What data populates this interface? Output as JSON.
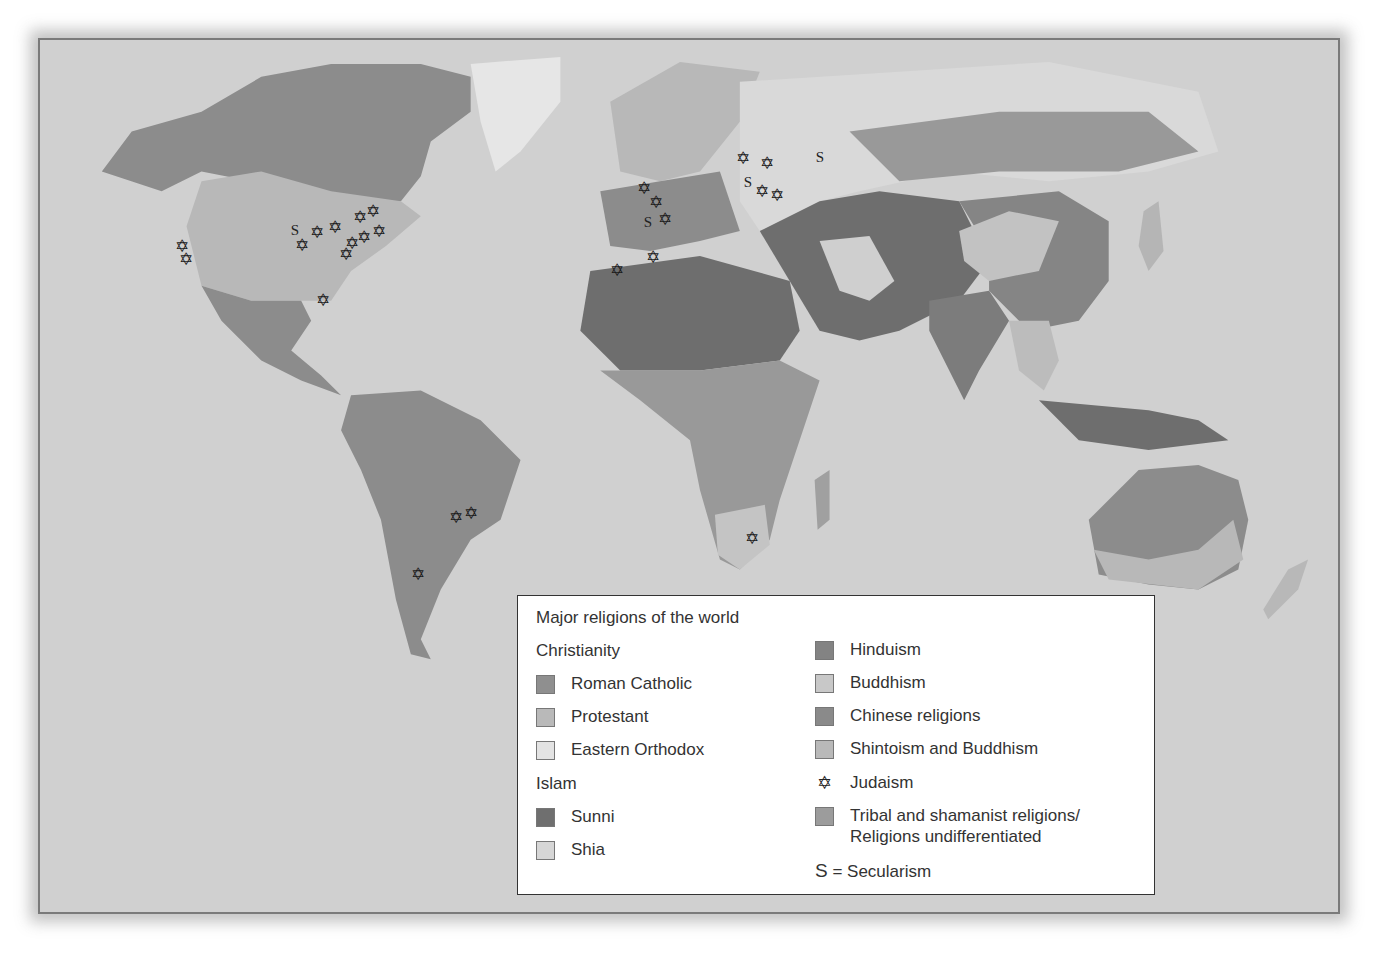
{
  "map": {
    "ocean_color": "#d0d0d0",
    "land_colors": {
      "roman_catholic": "#8c8c8c",
      "protestant": "#b8b8b8",
      "eastern_orthodox": "#d9d9d9",
      "sunni": "#6e6e6e",
      "shia": "#cfcfcf",
      "hinduism": "#7c7c7c",
      "buddhism": "#c2c2c2",
      "chinese_religions": "#858585",
      "shintoism_buddhism": "#b5b5b5",
      "tribal": "#999999"
    },
    "judaism_markers": [
      {
        "x": 182,
        "y": 246
      },
      {
        "x": 186,
        "y": 259
      },
      {
        "x": 302,
        "y": 245
      },
      {
        "x": 317,
        "y": 232
      },
      {
        "x": 335,
        "y": 227
      },
      {
        "x": 360,
        "y": 217
      },
      {
        "x": 373,
        "y": 211
      },
      {
        "x": 379,
        "y": 231
      },
      {
        "x": 364,
        "y": 237
      },
      {
        "x": 352,
        "y": 243
      },
      {
        "x": 346,
        "y": 254
      },
      {
        "x": 323,
        "y": 300
      },
      {
        "x": 644,
        "y": 188
      },
      {
        "x": 656,
        "y": 202
      },
      {
        "x": 665,
        "y": 219
      },
      {
        "x": 617,
        "y": 270
      },
      {
        "x": 653,
        "y": 257
      },
      {
        "x": 743,
        "y": 158
      },
      {
        "x": 767,
        "y": 163
      },
      {
        "x": 762,
        "y": 191
      },
      {
        "x": 777,
        "y": 195
      },
      {
        "x": 456,
        "y": 517
      },
      {
        "x": 471,
        "y": 513
      },
      {
        "x": 418,
        "y": 574
      },
      {
        "x": 752,
        "y": 538
      }
    ],
    "secularism_markers": [
      {
        "x": 295,
        "y": 230
      },
      {
        "x": 648,
        "y": 222
      },
      {
        "x": 748,
        "y": 182
      },
      {
        "x": 820,
        "y": 157
      }
    ],
    "judaism_glyph": "✡",
    "secularism_glyph": "S"
  },
  "legend": {
    "title": "Major religions of the world",
    "christianity": {
      "heading": "Christianity",
      "items": [
        {
          "label": "Roman Catholic",
          "color": "#8f8f8f"
        },
        {
          "label": "Protestant",
          "color": "#b9b9b9"
        },
        {
          "label": "Eastern Orthodox",
          "color": "#e3e3e3"
        }
      ]
    },
    "islam": {
      "heading": "Islam",
      "items": [
        {
          "label": "Sunni",
          "color": "#6f6f6f"
        },
        {
          "label": "Shia",
          "color": "#d6d6d6"
        }
      ]
    },
    "others": [
      {
        "label": "Hinduism",
        "color": "#838383",
        "icon": "swatch"
      },
      {
        "label": "Buddhism",
        "color": "#c8c8c8",
        "icon": "swatch"
      },
      {
        "label": "Chinese religions",
        "color": "#8a8a8a",
        "icon": "swatch"
      },
      {
        "label": "Shintoism and Buddhism",
        "color": "#b9b9b9",
        "icon": "swatch"
      },
      {
        "label": "Judaism",
        "icon": "star-of-david",
        "glyph": "✡"
      },
      {
        "label_line1": "Tribal and shamanist religions/",
        "label_line2": "Religions undifferentiated",
        "color": "#9c9c9c",
        "icon": "swatch"
      }
    ],
    "secularism": {
      "symbol": "S",
      "text": " = Secularism"
    }
  }
}
